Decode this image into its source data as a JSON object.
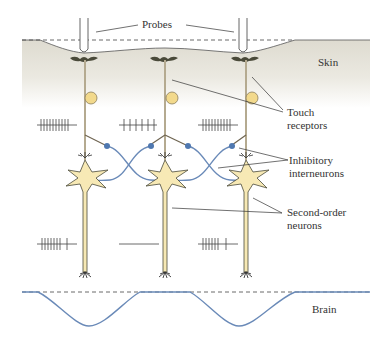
{
  "figure": {
    "labels": {
      "probes": "Probes",
      "skin": "Skin",
      "touch_receptors": [
        "Touch",
        "receptors"
      ],
      "inhibitory_interneurons": [
        "Inhibitory",
        "interneurons"
      ],
      "second_order_neurons": [
        "Second-order",
        "neurons"
      ],
      "brain": "Brain"
    },
    "columns": [
      {
        "x": 85,
        "receptor_firing_spikes": 10,
        "second_order_spikes": 8
      },
      {
        "x": 165,
        "receptor_firing_spikes": 6,
        "second_order_spikes": 0
      },
      {
        "x": 246,
        "receptor_firing_spikes": 10,
        "second_order_spikes": 7
      }
    ],
    "colors": {
      "skin": "#e6e3d9",
      "neuron_body": "#f7e9b5",
      "axon": "#8b7d5c",
      "interneuron": "#5b84b8",
      "receptor_bulb": "#f2d98c",
      "brain_curve": "#6a8ab8"
    }
  }
}
